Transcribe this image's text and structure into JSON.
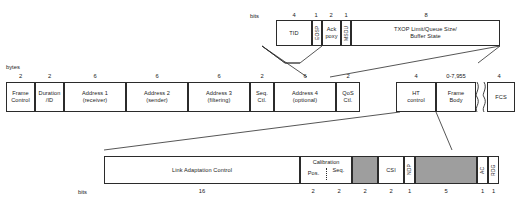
{
  "diagram": {
    "units": {
      "bits_label": "bits",
      "bytes_label": "bytes"
    },
    "colors": {
      "stroke": "#2b2b2b",
      "shaded_fill": "#9e9e9e",
      "background": "#ffffff"
    }
  },
  "qos_control_row": {
    "unit": "bits",
    "fields": [
      {
        "name": "tid",
        "line1": "TID",
        "line2": "",
        "size": "4",
        "vertical": false,
        "shaded": false
      },
      {
        "name": "eosp",
        "line1": "EOSP",
        "line2": "",
        "size": "1",
        "vertical": true,
        "shaded": false
      },
      {
        "name": "ack-policy",
        "line1": "Ack",
        "line2": "poxy",
        "size": "2",
        "vertical": false,
        "shaded": false
      },
      {
        "name": "msdu",
        "line1": "MSDU",
        "line2": "",
        "size": "1",
        "vertical": true,
        "shaded": false
      },
      {
        "name": "txop-limit",
        "line1": "TXOP Limit/Queue Size/",
        "line2": "Buffer State",
        "size": "8",
        "vertical": false,
        "shaded": false
      }
    ]
  },
  "mac_frame_row": {
    "unit": "bytes",
    "fields": [
      {
        "name": "frame-control",
        "line1": "Frame",
        "line2": "Control",
        "size": "2"
      },
      {
        "name": "duration-id",
        "line1": "Duration",
        "line2": "/ID",
        "size": "2"
      },
      {
        "name": "address-1",
        "line1": "Address 1",
        "line2": "(receiver)",
        "size": "6"
      },
      {
        "name": "address-2",
        "line1": "Address 2",
        "line2": "(sender)",
        "size": "6"
      },
      {
        "name": "address-3",
        "line1": "Address 3",
        "line2": "(filtering)",
        "size": "6"
      },
      {
        "name": "sequence-control",
        "line1": "Seq.",
        "line2": "Ctl.",
        "size": "2"
      },
      {
        "name": "address-4",
        "line1": "Address 4",
        "line2": "(optional)",
        "size": "6"
      },
      {
        "name": "qos-control",
        "line1": "QoS",
        "line2": "Ctl.",
        "size": "2"
      },
      {
        "name": "ht-control",
        "line1": "HT",
        "line2": "control",
        "size": "4"
      },
      {
        "name": "frame-body",
        "line1": "Frame",
        "line2": "Body",
        "size": "0-7,955"
      },
      {
        "name": "fcs",
        "line1": "FCS",
        "line2": "",
        "size": "4"
      }
    ]
  },
  "ht_control_row": {
    "unit": "bits",
    "fields": [
      {
        "name": "link-adaptation-control",
        "line1": "Link Adaptation Control",
        "line2": "",
        "size": "16",
        "vertical": false,
        "shaded": false
      },
      {
        "name": "calibration-position",
        "line1": "Calibration",
        "line2": "Pos.",
        "size": "2",
        "vertical": false,
        "shaded": false
      },
      {
        "name": "calibration-sequence",
        "line1": "",
        "line2": "Seq.",
        "size": "2",
        "vertical": false,
        "shaded": false
      },
      {
        "name": "reserved-1",
        "line1": "",
        "line2": "",
        "size": "2",
        "vertical": false,
        "shaded": true
      },
      {
        "name": "csi",
        "line1": "CSI",
        "line2": "",
        "size": "2",
        "vertical": false,
        "shaded": false
      },
      {
        "name": "ndp",
        "line1": "NDP",
        "line2": "",
        "size": "1",
        "vertical": true,
        "shaded": false
      },
      {
        "name": "reserved-2",
        "line1": "",
        "line2": "",
        "size": "5",
        "vertical": false,
        "shaded": true
      },
      {
        "name": "ac",
        "line1": "AC",
        "line2": "",
        "size": "1",
        "vertical": true,
        "shaded": false
      },
      {
        "name": "rdg",
        "line1": "RDG",
        "line2": "",
        "size": "1",
        "vertical": true,
        "shaded": false
      }
    ]
  }
}
